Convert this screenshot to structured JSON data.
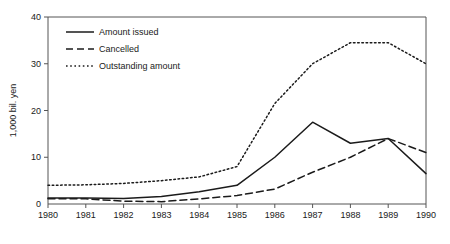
{
  "chart_data": {
    "type": "line",
    "title": "",
    "xlabel": "",
    "ylabel": "1,000 bil. yen",
    "x": [
      1980,
      1981,
      1982,
      1983,
      1984,
      1985,
      1986,
      1987,
      1988,
      1989,
      1990
    ],
    "xtick_labels": [
      "1980",
      "1981",
      "1982",
      "1983",
      "1984",
      "1985",
      "1986",
      "1987",
      "1988",
      "1989",
      "1990"
    ],
    "ytick_labels": [
      "0",
      "10",
      "20",
      "30",
      "40"
    ],
    "ytick_values": [
      0,
      10,
      20,
      30,
      40
    ],
    "xlim": [
      1980,
      1990
    ],
    "ylim": [
      0,
      40
    ],
    "grid": false,
    "legend_position": "top-left",
    "series": [
      {
        "name": "Amount issued",
        "style": "solid",
        "values": [
          1.3,
          1.3,
          1.2,
          1.6,
          2.6,
          4.0,
          10.0,
          17.5,
          13.0,
          14.0,
          6.5
        ]
      },
      {
        "name": "Cancelled",
        "style": "dashed",
        "values": [
          1.1,
          1.1,
          0.6,
          0.5,
          1.1,
          1.8,
          3.2,
          6.8,
          10.0,
          14.0,
          11.0
        ]
      },
      {
        "name": "Outstanding amount",
        "style": "dotted",
        "values": [
          4.0,
          4.1,
          4.4,
          5.0,
          5.8,
          8.0,
          21.5,
          30.0,
          34.5,
          34.5,
          30.0
        ]
      }
    ]
  },
  "legend": {
    "items": [
      {
        "label": "Amount issued",
        "style": "solid"
      },
      {
        "label": "Cancelled",
        "style": "dashed"
      },
      {
        "label": "Outstanding amount",
        "style": "dotted"
      }
    ]
  },
  "colors": {
    "ink": "#1b1b1b",
    "axis": "#555555",
    "background": "#ffffff"
  }
}
